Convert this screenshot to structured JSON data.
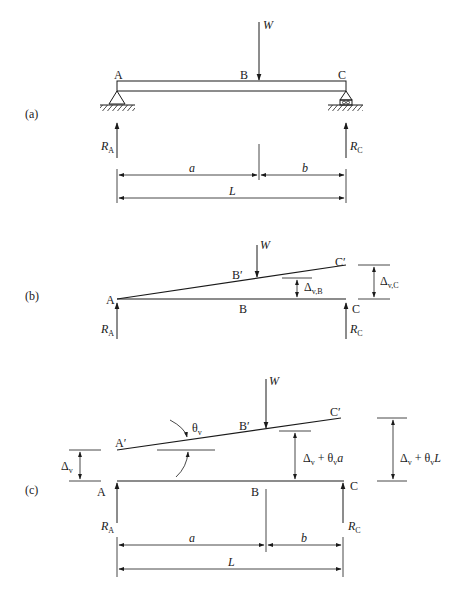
{
  "figure": {
    "panels": [
      {
        "id": "a",
        "label": "(a)",
        "points": {
          "A": "A",
          "B": "B",
          "C": "C"
        },
        "load": "W",
        "reactions": {
          "left": "R",
          "left_sub": "A",
          "right": "R",
          "right_sub": "C"
        },
        "dimensions": {
          "a": "a",
          "b": "b",
          "L": "L"
        },
        "supports": {
          "left": "pin",
          "right": "roller"
        }
      },
      {
        "id": "b",
        "label": "(b)",
        "points": {
          "A": "A",
          "B": "B",
          "C": "C",
          "B_prime": "B′",
          "C_prime": "C′"
        },
        "load": "W",
        "reactions": {
          "left": "R",
          "left_sub": "A",
          "right": "R",
          "right_sub": "C"
        },
        "deflections": {
          "at_B": "Δ",
          "at_B_sub": "v,B",
          "at_C": "Δ",
          "at_C_sub": "v,C"
        }
      },
      {
        "id": "c",
        "label": "(c)",
        "points": {
          "A": "A",
          "B": "B",
          "C": "C",
          "A_prime": "A′",
          "B_prime": "B′",
          "C_prime": "C′"
        },
        "load": "W",
        "rotation": {
          "symbol": "θ",
          "sub": "v"
        },
        "reactions": {
          "left": "R",
          "left_sub": "A",
          "right": "R",
          "right_sub": "C"
        },
        "deflections": {
          "at_A": "Δ",
          "at_A_sub": "v",
          "at_B_main": "Δ",
          "at_B_sub1": "v",
          "at_B_plus": " + θ",
          "at_B_sub2": "v",
          "at_B_var": "a",
          "at_C_main": "Δ",
          "at_C_sub1": "v",
          "at_C_plus": " + θ",
          "at_C_sub2": "v",
          "at_C_var": "L"
        },
        "dimensions": {
          "a": "a",
          "b": "b",
          "L": "L"
        }
      }
    ]
  }
}
